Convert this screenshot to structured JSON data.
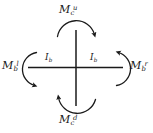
{
  "figure": {
    "background_color": "#ffffff",
    "stroke_color": "#1a1a1a",
    "members": {
      "column_label": "column",
      "beam_label": "beam",
      "center_x": 76,
      "center_y": 67,
      "beam_left_x": 28,
      "beam_right_x": 123,
      "column_top_y": 30,
      "column_bottom_y": 106
    },
    "moment_labels": {
      "top": {
        "base": "M",
        "sub": "c",
        "sup": "u",
        "full": "M_c^u"
      },
      "bottom": {
        "base": "M",
        "sub": "c",
        "sup": "d",
        "full": "M_c^d"
      },
      "left": {
        "base": "M",
        "sub": "b",
        "sup": "l",
        "full": "M_b^l"
      },
      "right": {
        "base": "M",
        "sub": "b",
        "sup": "r",
        "full": "M_b^r"
      }
    },
    "inner_labels": {
      "left": {
        "base": "I",
        "sub": "b",
        "full": "I_b"
      },
      "right": {
        "base": "I",
        "sub": "b",
        "full": "I_b"
      }
    },
    "arcs": {
      "top": {
        "name": "top-moment-arc",
        "opens": "down",
        "arrow_end": "right",
        "rotation": "clockwise"
      },
      "bottom": {
        "name": "bottom-moment-arc",
        "opens": "up",
        "arrow_end": "left",
        "rotation": "clockwise"
      },
      "left": {
        "name": "left-moment-arc",
        "opens": "right",
        "arrow_end": "bottom",
        "rotation": "clockwise"
      },
      "right": {
        "name": "right-moment-arc",
        "opens": "left",
        "arrow_end": "top",
        "rotation": "clockwise"
      }
    }
  }
}
